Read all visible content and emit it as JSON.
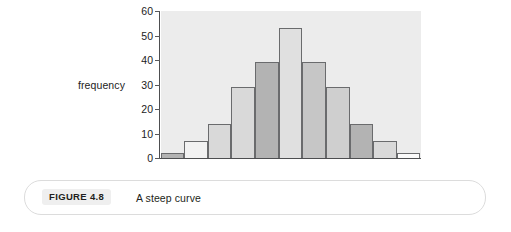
{
  "figure": {
    "caption_tag": "FIGURE 4.8",
    "caption_text": "A steep curve"
  },
  "chart_data": {
    "type": "bar",
    "title": "",
    "subtitle": "",
    "xlabel": "",
    "ylabel": "frequency",
    "ylim": [
      0,
      60
    ],
    "xlim": [
      0,
      11
    ],
    "grid": false,
    "legend": null,
    "y_ticks": [
      0,
      10,
      20,
      30,
      40,
      50,
      60
    ],
    "y_tick_labels": [
      "0",
      "10",
      "20",
      "30",
      "40",
      "50",
      "60"
    ],
    "x_tick_labels": [],
    "categories": [
      "1",
      "2",
      "3",
      "4",
      "5",
      "6",
      "7",
      "8",
      "9",
      "10",
      "11"
    ],
    "values": [
      2,
      7,
      14,
      29,
      39,
      53,
      39,
      29,
      14,
      7,
      2
    ],
    "bar_fills": [
      "#b3b3b3",
      "#f2f2f2",
      "#d9d9d9",
      "#d9d9d9",
      "#b3b3b3",
      "#e0e0e0",
      "#c6c6c6",
      "#cfcfcf",
      "#b3b3b3",
      "#d9d9d9",
      "#fafafa"
    ],
    "bar_edge_color": "#6a6b6d",
    "plot_background": "#ececec",
    "axis_color": "#4d4e50"
  }
}
